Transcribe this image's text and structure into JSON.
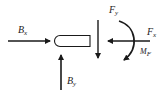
{
  "diagram": {
    "type": "free-body-diagram",
    "colors": {
      "stroke": "#1a1a1a",
      "background": "#ffffff"
    },
    "labels": {
      "bx": {
        "main": "B",
        "sub": "x"
      },
      "by": {
        "main": "B",
        "sub": "y"
      },
      "fy": {
        "main": "F",
        "sub": "y"
      },
      "fx": {
        "main": "F",
        "sub": "x"
      },
      "mf": {
        "main": "M",
        "sub": "F"
      }
    },
    "forces": [
      {
        "name": "B_x",
        "direction": "right"
      },
      {
        "name": "B_y",
        "direction": "up"
      },
      {
        "name": "F_y",
        "direction": "down"
      },
      {
        "name": "F_x",
        "direction": "left"
      },
      {
        "name": "M_F",
        "direction": "clockwise"
      }
    ]
  }
}
